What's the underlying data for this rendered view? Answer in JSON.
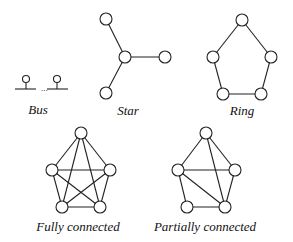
{
  "diagram": {
    "topologies": [
      {
        "id": "bus",
        "label": "Bus",
        "label_pos": [
          38,
          110
        ],
        "bus": {
          "segments": [
            [
              15,
              89,
              36,
              89
            ],
            [
              47,
              89,
              68,
              89
            ]
          ],
          "ellipsis": "...",
          "ellipsis_pos": [
            41,
            91
          ],
          "drops": [
            [
              26,
              83,
              26,
              89
            ],
            [
              57,
              83,
              57,
              89
            ]
          ],
          "nodes": [
            [
              26,
              79,
              3.5
            ],
            [
              57,
              79,
              3.5
            ]
          ]
        }
      },
      {
        "id": "star",
        "label": "Star",
        "label_pos": [
          128,
          111
        ],
        "nodes": [
          [
            106,
            19
          ],
          [
            125,
            57
          ],
          [
            165,
            57
          ],
          [
            106,
            93
          ]
        ],
        "edges": [
          [
            0,
            1
          ],
          [
            1,
            2
          ],
          [
            1,
            3
          ]
        ]
      },
      {
        "id": "ring",
        "label": "Ring",
        "label_pos": [
          242,
          111
        ],
        "nodes": [
          [
            242,
            20
          ],
          [
            213,
            57
          ],
          [
            271,
            57
          ],
          [
            223,
            94
          ],
          [
            261,
            94
          ]
        ],
        "edges": [
          [
            0,
            1
          ],
          [
            0,
            2
          ],
          [
            1,
            3
          ],
          [
            2,
            4
          ],
          [
            3,
            4
          ]
        ]
      },
      {
        "id": "fully-connected",
        "label": "Fully connected",
        "label_pos": [
          78,
          227
        ],
        "nodes": [
          [
            81,
            133
          ],
          [
            52,
            170
          ],
          [
            110,
            170
          ],
          [
            62,
            207
          ],
          [
            100,
            207
          ]
        ],
        "edges": [
          [
            0,
            1
          ],
          [
            0,
            2
          ],
          [
            0,
            3
          ],
          [
            0,
            4
          ],
          [
            1,
            2
          ],
          [
            1,
            3
          ],
          [
            1,
            4
          ],
          [
            2,
            3
          ],
          [
            2,
            4
          ],
          [
            3,
            4
          ]
        ]
      },
      {
        "id": "partially-connected",
        "label": "Partially connected",
        "label_pos": [
          205,
          227
        ],
        "nodes": [
          [
            206,
            133
          ],
          [
            178,
            170
          ],
          [
            235,
            170
          ],
          [
            187,
            207
          ],
          [
            225,
            207
          ]
        ],
        "edges": [
          [
            0,
            1
          ],
          [
            0,
            2
          ],
          [
            0,
            4
          ],
          [
            1,
            2
          ],
          [
            1,
            3
          ],
          [
            1,
            4
          ],
          [
            2,
            4
          ],
          [
            3,
            4
          ]
        ]
      }
    ],
    "node_radius": 6,
    "colors": {
      "stroke": "#222222",
      "node_fill": "#ffffff",
      "background": "#ffffff"
    }
  }
}
